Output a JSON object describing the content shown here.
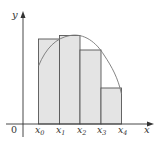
{
  "diagram": {
    "type": "riemann-sum-left-endpoints",
    "axes": {
      "x_label": "x",
      "y_label": "y",
      "origin_label": "0"
    },
    "partition_labels": [
      {
        "base": "x",
        "sub": "0"
      },
      {
        "base": "x",
        "sub": "1"
      },
      {
        "base": "x",
        "sub": "2"
      },
      {
        "base": "x",
        "sub": "3"
      },
      {
        "base": "x",
        "sub": "4"
      }
    ],
    "rectangles": 4,
    "colors": {
      "fill": "#e4e4e4",
      "stroke": "#555555",
      "curve": "#777777",
      "axis": "#333333"
    }
  }
}
